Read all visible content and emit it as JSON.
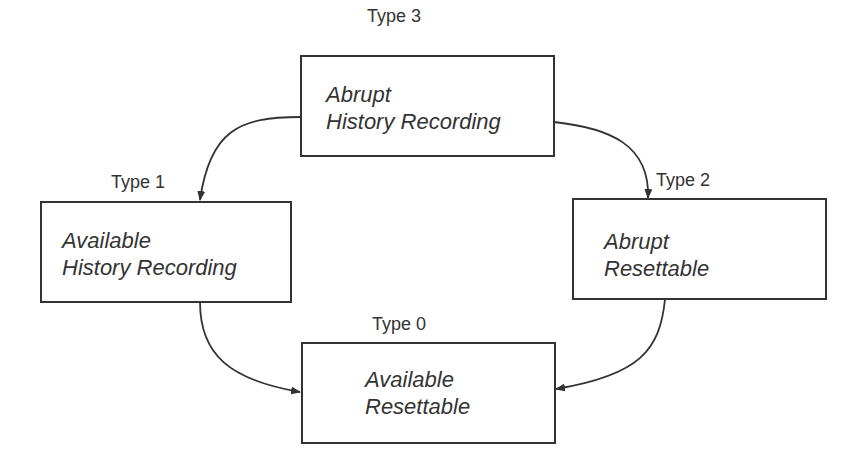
{
  "diagram": {
    "nodes": [
      {
        "id": "type3",
        "type_label": "Type 3",
        "line1": "Abrupt",
        "line2": "History Recording"
      },
      {
        "id": "type1",
        "type_label": "Type 1",
        "line1": "Available",
        "line2": "History Recording"
      },
      {
        "id": "type2",
        "type_label": "Type 2",
        "line1": "Abrupt",
        "line2": "Resettable"
      },
      {
        "id": "type0",
        "type_label": "Type 0",
        "line1": "Available",
        "line2": "Resettable"
      }
    ],
    "edges": [
      {
        "from": "type3",
        "to": "type1"
      },
      {
        "from": "type3",
        "to": "type2"
      },
      {
        "from": "type1",
        "to": "type0"
      },
      {
        "from": "type2",
        "to": "type0"
      }
    ],
    "colors": {
      "line": "#333333",
      "background": "#ffffff"
    }
  }
}
